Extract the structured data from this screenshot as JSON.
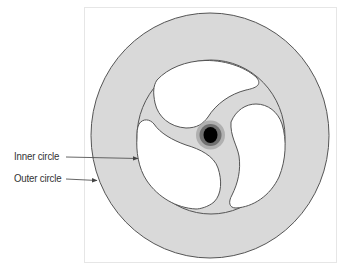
{
  "diagram": {
    "type": "mechanical cross-section",
    "labels": [
      {
        "id": "inner",
        "text": "Inner circle"
      },
      {
        "id": "outer",
        "text": "Outer circle"
      }
    ],
    "colors": {
      "ring_fill": "#d9d9d9",
      "stroke": "#555555",
      "cutout_fill": "#ffffff",
      "hub_core": "#000000",
      "hub_ring": "#707070",
      "hub_halo": "#a8a8a8",
      "frame": "#e6e6e6"
    }
  }
}
